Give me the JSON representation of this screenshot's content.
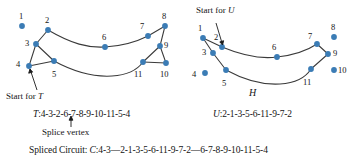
{
  "figure": {
    "dot_color": "#3b7cb5",
    "edge_color": "#3a3a3a",
    "left_graph": {
      "name": "",
      "start_label": "Start for T",
      "start_label_italic_part": "T",
      "vertices": [
        {
          "id": "1",
          "x": 22,
          "y": 26,
          "lx": 19,
          "ly": 12
        },
        {
          "id": "2",
          "x": 48,
          "y": 30,
          "lx": 45,
          "ly": 16
        },
        {
          "id": "3",
          "x": 36,
          "y": 44,
          "lx": 25,
          "ly": 39
        },
        {
          "id": "4",
          "x": 29,
          "y": 66,
          "lx": 16,
          "ly": 60
        },
        {
          "id": "5",
          "x": 54,
          "y": 61,
          "lx": 52,
          "ly": 70
        },
        {
          "id": "6",
          "x": 105,
          "y": 47,
          "lx": 102,
          "ly": 33
        },
        {
          "id": "7",
          "x": 148,
          "y": 36,
          "lx": 140,
          "ly": 22
        },
        {
          "id": "8",
          "x": 165,
          "y": 26,
          "lx": 162,
          "ly": 12
        },
        {
          "id": "9",
          "x": 160,
          "y": 46,
          "lx": 164,
          "ly": 41
        },
        {
          "id": "10",
          "x": 166,
          "y": 63,
          "lx": 160,
          "ly": 70
        },
        {
          "id": "11",
          "x": 143,
          "y": 62,
          "lx": 134,
          "ly": 70
        }
      ]
    },
    "right_graph": {
      "name": "H",
      "start_label": "Start for U",
      "start_label_italic_part": "U",
      "vertices": [
        {
          "id": "1",
          "x": 203,
          "y": 38,
          "lx": 198,
          "ly": 24
        },
        {
          "id": "2",
          "x": 222,
          "y": 47,
          "lx": 214,
          "ly": 33
        },
        {
          "id": "3",
          "x": 213,
          "y": 53,
          "lx": 202,
          "ly": 48
        },
        {
          "id": "4",
          "x": 205,
          "y": 73,
          "lx": 192,
          "ly": 70
        },
        {
          "id": "5",
          "x": 226,
          "y": 70,
          "lx": 222,
          "ly": 79
        },
        {
          "id": "6",
          "x": 277,
          "y": 57,
          "lx": 272,
          "ly": 43
        },
        {
          "id": "7",
          "x": 317,
          "y": 44,
          "lx": 308,
          "ly": 32
        },
        {
          "id": "8",
          "x": 334,
          "y": 37,
          "lx": 331,
          "ly": 23
        },
        {
          "id": "9",
          "x": 328,
          "y": 54,
          "lx": 333,
          "ly": 49
        },
        {
          "id": "10",
          "x": 334,
          "y": 70,
          "lx": 338,
          "ly": 66
        },
        {
          "id": "11",
          "x": 311,
          "y": 69,
          "lx": 303,
          "ly": 78
        }
      ]
    }
  },
  "text": {
    "start_for_t": "Start for ",
    "start_for_t_italic": "T",
    "start_for_u": "Start for ",
    "start_for_u_italic": "U",
    "graph_h_name": "H",
    "t_circuit_prefix": "T",
    "t_circuit": ":4-3-2-6-7-8-9-10-11-5-4",
    "u_circuit_prefix": "U",
    "u_circuit": ":2-1-3-5-6-11-9-7-2",
    "splice_vertex": "Splice vertex",
    "spliced_label": "Spliced Circuit: ",
    "spliced_prefix": "C",
    "spliced_circuit": ":4-3—2-1-3-5-6-11-9-7-2—6-7-8-9-10-11-5-4"
  },
  "chart_data": {
    "type": "diagram",
    "graphs": [
      {
        "label": "left",
        "circuit_name": "T",
        "circuit_sequence": [
          4,
          3,
          2,
          6,
          7,
          8,
          9,
          10,
          11,
          5,
          4
        ],
        "start_vertex": 4,
        "splice_vertex": 2,
        "edges": [
          [
            "1",
            "2"
          ],
          [
            "2",
            "3"
          ],
          [
            "3",
            "4"
          ],
          [
            "4",
            "5"
          ],
          [
            "2",
            "6"
          ],
          [
            "6",
            "7"
          ],
          [
            "7",
            "8"
          ],
          [
            "8",
            "9"
          ],
          [
            "9",
            "10"
          ],
          [
            "10",
            "11"
          ],
          [
            "5",
            "11"
          ],
          [
            "3",
            "5"
          ],
          [
            "9",
            "11"
          ]
        ]
      },
      {
        "label": "right",
        "graph_name": "H",
        "circuit_name": "U",
        "circuit_sequence": [
          2,
          1,
          3,
          5,
          6,
          11,
          9,
          7,
          2
        ],
        "start_vertex": 2,
        "edges": [
          [
            "1",
            "2"
          ],
          [
            "1",
            "3"
          ],
          [
            "3",
            "5"
          ],
          [
            "2",
            "6"
          ],
          [
            "6",
            "7"
          ],
          [
            "7",
            "9"
          ],
          [
            "9",
            "11"
          ],
          [
            "5",
            "6"
          ],
          [
            "6",
            "11"
          ]
        ]
      }
    ],
    "spliced_circuit": {
      "name": "C",
      "sequence": "4-3—2-1-3-5-6-11-9-7-2—6-7-8-9-10-11-5-4"
    }
  }
}
